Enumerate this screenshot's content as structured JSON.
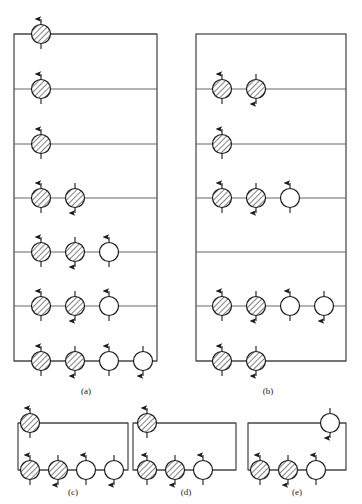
{
  "figure": {
    "type": "energy-level-occupation-diagram",
    "colors": {
      "stroke": "#1a1a1a",
      "level_line": "#555555",
      "background": "#ffffff",
      "hatch": "#1a1a1a",
      "empty_fill": "#ffffff"
    },
    "legend_semantics": {
      "hatched_circle": "occupied / filled state",
      "empty_circle": "unoccupied / empty state",
      "up_arrow": "spin up",
      "down_arrow": "spin down"
    },
    "panels": [
      {
        "id": "a",
        "caption": "(a)",
        "caption_x": 86,
        "caption_y": 386,
        "box": {
          "x": 14,
          "y": 34,
          "w": 143,
          "h": 327
        },
        "rows": [
          {
            "y": 34,
            "circles": [
              {
                "x": 41,
                "fill": "hatched",
                "arrow": "up"
              }
            ]
          },
          {
            "y": 89,
            "circles": [
              {
                "x": 41,
                "fill": "hatched",
                "arrow": "up"
              }
            ]
          },
          {
            "y": 144,
            "circles": [
              {
                "x": 41,
                "fill": "hatched",
                "arrow": "up"
              }
            ]
          },
          {
            "y": 198,
            "circles": [
              {
                "x": 41,
                "fill": "hatched",
                "arrow": "up"
              },
              {
                "x": 75,
                "fill": "hatched",
                "arrow": "down"
              }
            ]
          },
          {
            "y": 252,
            "circles": [
              {
                "x": 41,
                "fill": "hatched",
                "arrow": "up"
              },
              {
                "x": 75,
                "fill": "hatched",
                "arrow": "down"
              },
              {
                "x": 109,
                "fill": "empty",
                "arrow": "up"
              }
            ]
          },
          {
            "y": 306,
            "circles": [
              {
                "x": 41,
                "fill": "hatched",
                "arrow": "up"
              },
              {
                "x": 75,
                "fill": "hatched",
                "arrow": "down"
              },
              {
                "x": 109,
                "fill": "empty",
                "arrow": "up"
              }
            ]
          },
          {
            "y": 361,
            "circles": [
              {
                "x": 41,
                "fill": "hatched",
                "arrow": "up"
              },
              {
                "x": 75,
                "fill": "hatched",
                "arrow": "down"
              },
              {
                "x": 109,
                "fill": "empty",
                "arrow": "up"
              },
              {
                "x": 143,
                "fill": "empty",
                "arrow": "down"
              }
            ]
          }
        ]
      },
      {
        "id": "b",
        "caption": "(b)",
        "caption_x": 268,
        "caption_y": 386,
        "box": {
          "x": 196,
          "y": 34,
          "w": 150,
          "h": 327
        },
        "rows": [
          {
            "y": 89,
            "circles": [
              {
                "x": 222,
                "fill": "hatched",
                "arrow": "up"
              },
              {
                "x": 256,
                "fill": "hatched",
                "arrow": "down"
              }
            ]
          },
          {
            "y": 144,
            "circles": [
              {
                "x": 222,
                "fill": "hatched",
                "arrow": "up"
              }
            ]
          },
          {
            "y": 198,
            "circles": [
              {
                "x": 222,
                "fill": "hatched",
                "arrow": "up"
              },
              {
                "x": 256,
                "fill": "hatched",
                "arrow": "down"
              },
              {
                "x": 290,
                "fill": "empty",
                "arrow": "up"
              }
            ]
          },
          {
            "y": 252,
            "circles": []
          },
          {
            "y": 306,
            "circles": [
              {
                "x": 222,
                "fill": "hatched",
                "arrow": "up"
              },
              {
                "x": 256,
                "fill": "hatched",
                "arrow": "down"
              },
              {
                "x": 290,
                "fill": "empty",
                "arrow": "up"
              },
              {
                "x": 324,
                "fill": "empty",
                "arrow": "down"
              }
            ]
          },
          {
            "y": 361,
            "circles": [
              {
                "x": 222,
                "fill": "hatched",
                "arrow": "up"
              },
              {
                "x": 256,
                "fill": "hatched",
                "arrow": "down"
              }
            ]
          }
        ]
      },
      {
        "id": "c",
        "caption": "(c)",
        "caption_x": 73,
        "caption_y": 487,
        "box": {
          "x": 18,
          "y": 423,
          "w": 110,
          "h": 47
        },
        "rows": [
          {
            "y": 423,
            "circles": [
              {
                "x": 30,
                "fill": "hatched",
                "arrow": "up"
              }
            ]
          },
          {
            "y": 470,
            "circles": [
              {
                "x": 30,
                "fill": "hatched",
                "arrow": "up"
              },
              {
                "x": 58,
                "fill": "hatched",
                "arrow": "down"
              },
              {
                "x": 86,
                "fill": "empty",
                "arrow": "up"
              },
              {
                "x": 114,
                "fill": "empty",
                "arrow": "down"
              }
            ]
          }
        ]
      },
      {
        "id": "d",
        "caption": "(d)",
        "caption_x": 186,
        "caption_y": 487,
        "box": {
          "x": 133,
          "y": 423,
          "w": 103,
          "h": 47
        },
        "rows": [
          {
            "y": 423,
            "circles": [
              {
                "x": 147,
                "fill": "hatched",
                "arrow": "up"
              }
            ]
          },
          {
            "y": 470,
            "circles": [
              {
                "x": 147,
                "fill": "hatched",
                "arrow": "up"
              },
              {
                "x": 175,
                "fill": "hatched",
                "arrow": "down"
              },
              {
                "x": 203,
                "fill": "empty",
                "arrow": "up"
              }
            ]
          }
        ]
      },
      {
        "id": "e",
        "caption": "(e)",
        "caption_x": 297,
        "caption_y": 487,
        "box": {
          "x": 248,
          "y": 423,
          "w": 98,
          "h": 47
        },
        "rows": [
          {
            "y": 423,
            "circles": [
              {
                "x": 330,
                "fill": "empty",
                "arrow": "down"
              }
            ]
          },
          {
            "y": 470,
            "circles": [
              {
                "x": 260,
                "fill": "hatched",
                "arrow": "up"
              },
              {
                "x": 288,
                "fill": "hatched",
                "arrow": "down"
              },
              {
                "x": 316,
                "fill": "empty",
                "arrow": "up"
              }
            ]
          }
        ]
      }
    ]
  }
}
